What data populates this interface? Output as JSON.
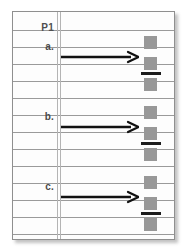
{
  "sheet": {
    "kind": "ruled-notebook-page",
    "header": {
      "label": "P1"
    },
    "rule_lines_y": [
      18,
      35,
      52,
      69,
      86,
      103,
      120,
      137,
      154,
      171,
      188,
      205,
      222
    ],
    "margin_rule_x": 44
  },
  "rows": [
    {
      "id": "a",
      "label": "a.",
      "label_y": 30,
      "arrow": {
        "name": "right-arrow",
        "y": 38,
        "from_x": 48,
        "to_x": 126
      },
      "glyphs": {
        "top_y": 24,
        "squares": [
          {
            "y": 24,
            "color": "#989898"
          },
          {
            "y": 45,
            "color": "#989898"
          },
          {
            "y": 66,
            "color": "#989898"
          }
        ],
        "fraction_bar": {
          "y": 60,
          "color": "#1c1c1c"
        }
      }
    },
    {
      "id": "b",
      "label": "b.",
      "label_y": 100,
      "arrow": {
        "name": "right-arrow",
        "y": 108,
        "from_x": 48,
        "to_x": 126
      },
      "glyphs": {
        "top_y": 94,
        "squares": [
          {
            "y": 94,
            "color": "#989898"
          },
          {
            "y": 115,
            "color": "#989898"
          },
          {
            "y": 136,
            "color": "#989898"
          }
        ],
        "fraction_bar": {
          "y": 130,
          "color": "#1c1c1c"
        }
      }
    },
    {
      "id": "c",
      "label": "c.",
      "label_y": 170,
      "arrow": {
        "name": "right-arrow",
        "y": 178,
        "from_x": 48,
        "to_x": 126
      },
      "glyphs": {
        "top_y": 164,
        "squares": [
          {
            "y": 164,
            "color": "#989898"
          },
          {
            "y": 185,
            "color": "#989898"
          },
          {
            "y": 206,
            "color": "#989898"
          }
        ],
        "fraction_bar": {
          "y": 200,
          "color": "#1c1c1c"
        }
      }
    }
  ],
  "colors": {
    "page_background": "#fdfdfd",
    "canvas_background": "#ffffff",
    "rule_line": "#9a9a9a",
    "margin_rule": "#b4b4b4",
    "border": "#8f8f8f",
    "text": "#4a4a4a",
    "square_fill": "#989898",
    "bar_fill": "#1c1c1c",
    "arrow": "#111111"
  }
}
